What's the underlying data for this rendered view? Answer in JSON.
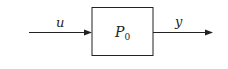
{
  "diagram": {
    "type": "block-diagram",
    "input": {
      "label": "u"
    },
    "block": {
      "label": "P",
      "subscript": "0"
    },
    "output": {
      "label": "y"
    },
    "colors": {
      "stroke": "#222222",
      "background": "#ffffff"
    }
  }
}
